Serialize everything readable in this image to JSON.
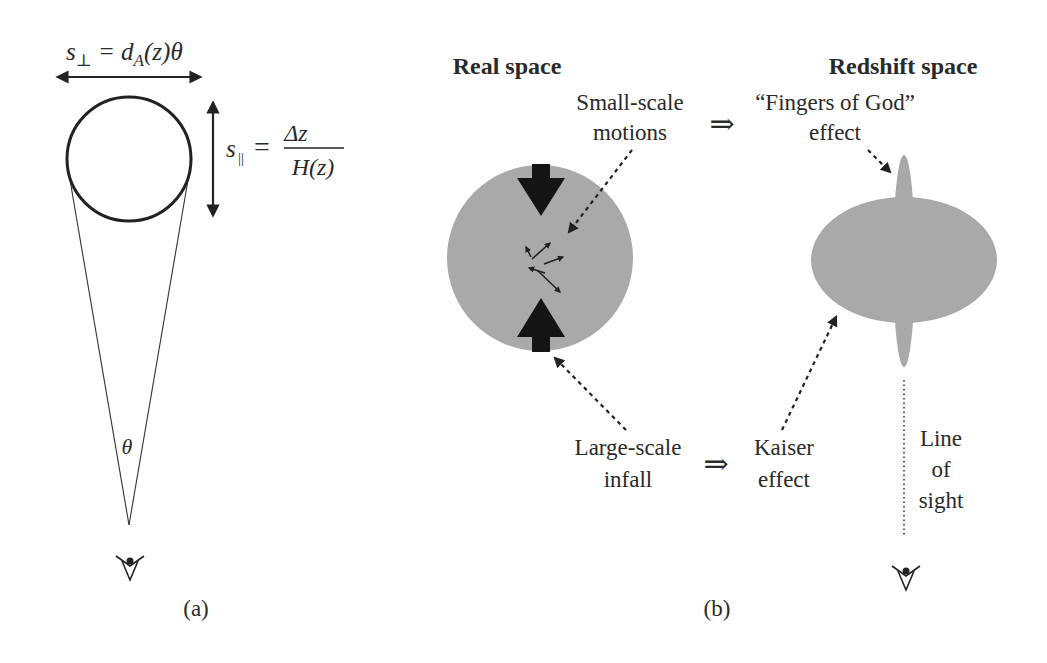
{
  "panel_a": {
    "label": "(a)",
    "perp_eq": {
      "s": "s",
      "sub": "⊥",
      "rhs_d": " = d",
      "rhs_sub": "A",
      "rhs_tail": "(z)θ"
    },
    "par_eq": {
      "s": "s",
      "sub": "||",
      "eq": "=",
      "num": "Δz",
      "den": "H(z)"
    },
    "angle_label": "θ",
    "observer_icon": "eye-icon"
  },
  "panel_b": {
    "label": "(b)",
    "real_title": "Real space",
    "redshift_title": "Redshift space",
    "small_scale": [
      "Small-scale",
      "motions"
    ],
    "fingers": [
      "“Fingers of God”",
      "effect"
    ],
    "large_scale": [
      "Large-scale",
      "infall"
    ],
    "kaiser": [
      "Kaiser",
      "effect"
    ],
    "line_of_sight": [
      "Line",
      "of",
      "sight"
    ],
    "implies": "⇒",
    "observer_icon": "eye-icon"
  },
  "colors": {
    "ink": "#222222",
    "gray_fill": "#a9a9a9",
    "text": "#2a2a2a"
  }
}
